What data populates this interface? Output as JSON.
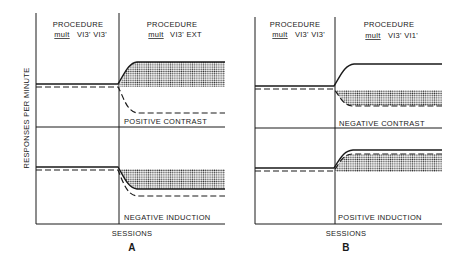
{
  "figure": {
    "y_axis_label": "RESPONSES PER MINUTE",
    "x_axis_label": "SESSIONS",
    "panels": [
      {
        "id": "A",
        "label": "A",
        "phase1": {
          "title": "PROCEDURE",
          "mult": "mult",
          "schedule": "VI3' VI3'"
        },
        "phase2": {
          "title": "PROCEDURE",
          "mult": "mult",
          "schedule": "VI3' EXT"
        },
        "upper_label": "POSITIVE CONTRAST",
        "lower_label": "NEGATIVE INDUCTION"
      },
      {
        "id": "B",
        "label": "B",
        "phase1": {
          "title": "PROCEDURE",
          "mult": "mult",
          "schedule": "VI3' VI3'"
        },
        "phase2": {
          "title": "PROCEDURE",
          "mult": "mult",
          "schedule": "VI3' VI1'"
        },
        "upper_label": "NEGATIVE CONTRAST",
        "lower_label": "POSITIVE INDUCTION"
      }
    ]
  },
  "colors": {
    "ink": "#1a1a1a",
    "background": "#ffffff"
  }
}
